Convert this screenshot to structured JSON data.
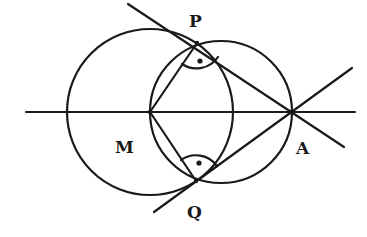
{
  "diagram": {
    "type": "geometry",
    "colors": {
      "stroke": "#1a1a1a",
      "background": "#ffffff"
    },
    "points": {
      "M": {
        "label": "M",
        "x": 150,
        "y": 112
      },
      "A": {
        "label": "A",
        "x": 291,
        "y": 112
      },
      "P": {
        "label": "P",
        "x": 197,
        "y": 43
      },
      "Q": {
        "label": "Q",
        "x": 196,
        "y": 181
      }
    },
    "circles": [
      {
        "name": "circle-center-M",
        "cx": 150,
        "cy": 112,
        "r": 83
      },
      {
        "name": "thales-circle-MA",
        "cx": 221,
        "cy": 112,
        "r": 71
      }
    ],
    "angle_marks": [
      {
        "at": "P",
        "type": "right-angle-dot"
      },
      {
        "at": "Q",
        "type": "right-angle-dot"
      }
    ]
  }
}
